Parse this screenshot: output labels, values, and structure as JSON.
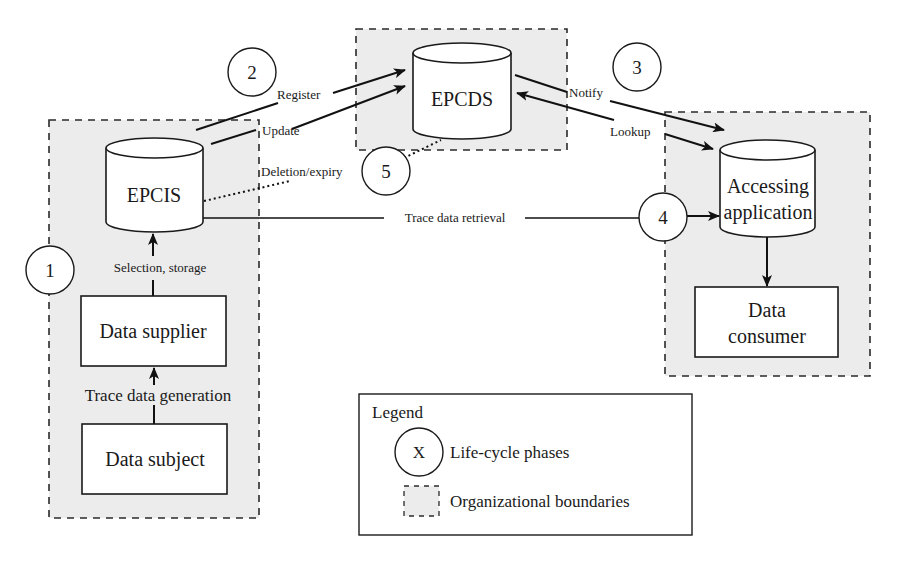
{
  "diagram": {
    "nodes": {
      "epcis": {
        "label": "EPCIS",
        "shape": "cylinder"
      },
      "epcds": {
        "label": "EPCDS",
        "shape": "cylinder"
      },
      "accessing_application": {
        "label_line1": "Accessing",
        "label_line2": "application",
        "shape": "cylinder"
      },
      "data_consumer": {
        "label_line1": "Data",
        "label_line2": "consumer",
        "shape": "rectangle"
      },
      "data_supplier": {
        "label": "Data supplier",
        "shape": "rectangle"
      },
      "data_subject": {
        "label": "Data subject",
        "shape": "rectangle"
      }
    },
    "phases": {
      "p1": "1",
      "p2": "2",
      "p3": "3",
      "p4": "4",
      "p5": "5"
    },
    "edges": {
      "register": "Register",
      "update": "Update",
      "notify": "Notify",
      "lookup": "Lookup",
      "deletion_expiry": "Deletion/expiry",
      "trace_data_retrieval": "Trace data retrieval",
      "selection_storage": "Selection, storage",
      "trace_data_generation": "Trace data generation"
    },
    "legend": {
      "title": "Legend",
      "phase_symbol": "X",
      "phase_label": "Life-cycle phases",
      "boundary_label": "Organizational boundaries"
    },
    "colors": {
      "boundary_fill": "#ececec",
      "stroke": "#1a1a1a",
      "background": "#ffffff"
    }
  }
}
